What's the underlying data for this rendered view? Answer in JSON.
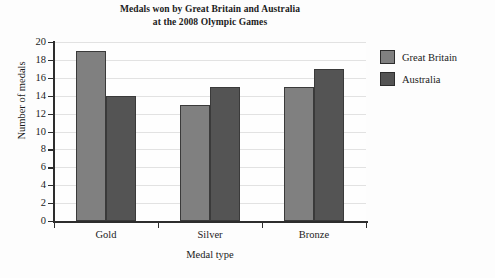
{
  "chart_data": {
    "type": "bar",
    "title": "Medals won by Great Britain and Australia at the 2008 Olympic Games",
    "title_line1": "Medals won by Great Britain and Australia",
    "title_line2": "at the 2008 Olympic Games",
    "xlabel": "Medal type",
    "ylabel": "Number of medals",
    "categories": [
      "Gold",
      "Silver",
      "Bronze"
    ],
    "series": [
      {
        "name": "Great Britain",
        "values": [
          19,
          13,
          15
        ],
        "color": "#808080"
      },
      {
        "name": "Australia",
        "values": [
          14,
          15,
          17
        ],
        "color": "#545454"
      }
    ],
    "ylim": [
      0,
      20
    ],
    "ytick_labels": [
      "0",
      "2",
      "4",
      "6",
      "8",
      "10",
      "12",
      "14",
      "16",
      "18",
      "20"
    ],
    "ytick_values": [
      0,
      2,
      4,
      6,
      8,
      10,
      12,
      14,
      16,
      18,
      20
    ],
    "grid": true,
    "legend_position": "right"
  },
  "legend": {
    "items": [
      {
        "label": "Great Britain",
        "swatch_name": "legend-swatch-great-britain"
      },
      {
        "label": "Australia",
        "swatch_name": "legend-swatch-australia"
      }
    ]
  }
}
